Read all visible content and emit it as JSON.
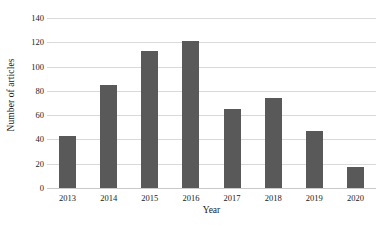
{
  "chart_data": {
    "type": "bar",
    "title": "",
    "subtitle": "",
    "xlabel": "Year",
    "ylabel": "Number of articles",
    "categories": [
      "2013",
      "2014",
      "2015",
      "2016",
      "2017",
      "2018",
      "2019",
      "2020"
    ],
    "values": [
      43,
      85,
      113,
      121,
      65,
      74,
      47,
      17
    ],
    "series": [
      {
        "name": "Number of articles",
        "values": [
          43,
          85,
          113,
          121,
          65,
          74,
          47,
          17
        ]
      }
    ],
    "ylim": [
      0,
      140
    ],
    "ytick_step": 20,
    "ytick_labels": [
      "0",
      "20",
      "40",
      "60",
      "80",
      "100",
      "120",
      "140"
    ],
    "grid": true,
    "grid_axis": "y",
    "legend": false,
    "legend_position": "none",
    "bar_color": "#595959",
    "gridline_color": "#d9d9d9",
    "background_color": "#ffffff",
    "text_color": "#1a1a1a",
    "annotations": []
  }
}
